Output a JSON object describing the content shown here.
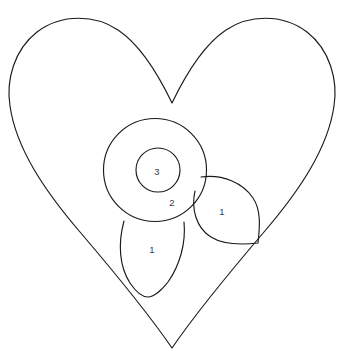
{
  "canvas": {
    "width": 341,
    "height": 360,
    "background_color": "#ffffff",
    "stroke_color": "#1a1a1a",
    "label_color": "#3a3a3a"
  },
  "figure": {
    "name": "heart-with-flower-line-drawing"
  },
  "shapes": {
    "heart": {
      "name": "heart-outline",
      "filled": false
    },
    "outer_circle": {
      "name": "flower-outer-circle",
      "cx": 155,
      "cy": 170,
      "r": 51.5
    },
    "inner_circle": {
      "name": "flower-inner-circle",
      "cx": 158,
      "cy": 170,
      "r": 22
    },
    "petal_bottom": {
      "name": "flower-petal-bottom"
    },
    "petal_right": {
      "name": "flower-petal-right"
    }
  },
  "labels": [
    {
      "id": "label-inner-circle",
      "text": "3",
      "x": 157,
      "y": 172
    },
    {
      "id": "label-outer-ring",
      "text": "2",
      "x": 172,
      "y": 203
    },
    {
      "id": "label-petal-right",
      "text": "1",
      "x": 222,
      "y": 212
    },
    {
      "id": "label-petal-bottom",
      "text": "1",
      "x": 152,
      "y": 250
    }
  ]
}
